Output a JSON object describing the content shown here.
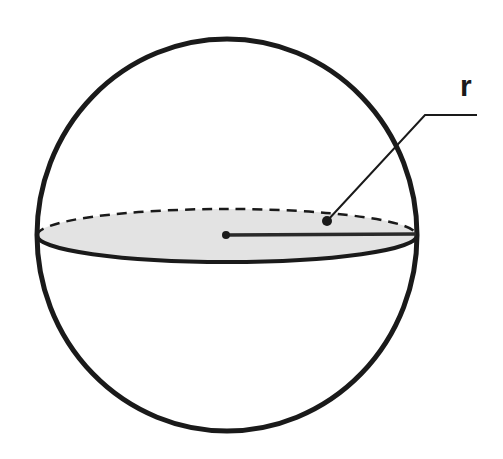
{
  "diagram": {
    "radius_label": "r",
    "colors": {
      "stroke": "#1a1a1a",
      "fill_cross_section": "#e3e3e3",
      "background": "#ffffff"
    },
    "elements": [
      {
        "id": "sphere-outline",
        "shape": "circle"
      },
      {
        "id": "equatorial-cross-section",
        "shape": "ellipse",
        "back_edge": "dashed",
        "front_edge": "solid"
      },
      {
        "id": "center-point",
        "shape": "dot"
      },
      {
        "id": "radius-line",
        "shape": "line",
        "from": "center",
        "to": "sphere-edge"
      },
      {
        "id": "leader-line",
        "shape": "polyline",
        "points_to": "cross-section"
      },
      {
        "id": "radius-label",
        "text": "r"
      }
    ]
  }
}
